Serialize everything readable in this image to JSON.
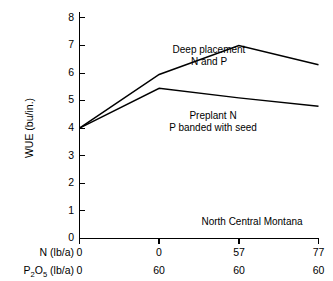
{
  "chart_data": {
    "type": "line",
    "title": "",
    "xlabel": "N (lb/a)",
    "ylabel": "WUE (bu/in.)",
    "ylim": [
      0,
      8
    ],
    "grid": false,
    "legend_position": "inline-annotation",
    "x_positions": [
      0,
      1,
      2,
      3
    ],
    "categories": [
      "0",
      "0",
      "57",
      "77"
    ],
    "x_axis_rows": [
      {
        "label": "N (lb/a)",
        "label_base": "N (lb/a)",
        "values": [
          "0",
          "0",
          "57",
          "77"
        ]
      },
      {
        "label": "P2O5 (lb/a)",
        "label_prefix": "P",
        "label_sub1": "2",
        "label_mid": "O",
        "label_sub2": "5",
        "label_suffix": " (lb/a)",
        "values": [
          "0",
          "60",
          "60",
          "60"
        ]
      }
    ],
    "y_ticks": [
      0,
      1,
      2,
      3,
      4,
      5,
      6,
      7,
      8
    ],
    "y_tick_labels": [
      "0",
      "1",
      "2",
      "3",
      "4",
      "5",
      "6",
      "7",
      "8"
    ],
    "series": [
      {
        "name": "Deep placement N and P",
        "label_line1": "Deep placement",
        "label_line2": "N and P",
        "values": [
          4.0,
          5.95,
          7.0,
          6.3
        ],
        "color": "#000000"
      },
      {
        "name": "Preplant N, P banded with seed",
        "label_line1": "Preplant N",
        "label_line2": "P banded with seed",
        "values": [
          4.0,
          5.45,
          5.1,
          4.8
        ],
        "color": "#000000"
      }
    ],
    "annotations": [
      {
        "name": "region-label",
        "text": "North Central Montana"
      }
    ]
  },
  "colors": {
    "line": "#000000",
    "axis": "#000000",
    "background": "#ffffff"
  }
}
